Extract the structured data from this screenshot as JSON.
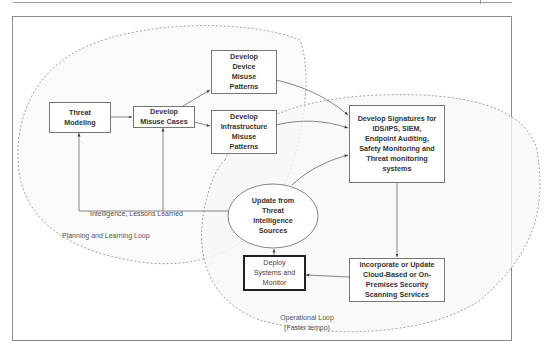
{
  "diagram": {
    "nodes": {
      "threat_modeling": {
        "label": "Threat\nModeling"
      },
      "misuse_cases": {
        "label": "Develop\nMisuse Cases"
      },
      "device_patterns": {
        "label": "Develop\nDevice\nMisuse\nPatterns"
      },
      "infra_patterns": {
        "label": "Develop\nInfrastructure\nMisuse\nPatterns"
      },
      "signatures": {
        "label": "Develop Signatures for\nIDS/IPS, SIEM,\nEndpoint Auditing,\nSafety Monitoring and\nThreat monitoring\nsystems"
      },
      "threat_intel": {
        "label": "Update from\nThreat\nIntelligence\nSources",
        "shape": "ellipse"
      },
      "deploy": {
        "label": "Deploy\nSystems and\nMonitor"
      },
      "incorporate": {
        "label": "Incorporate  or Update\nCloud-Based or On-\nPremises Security\nScanning Services"
      }
    },
    "edge_labels": {
      "feedback": "Intelligence, Lessons Learned"
    },
    "regions": {
      "planning_loop": "Planning and Learning Loop",
      "operational_loop": "Operational Loop\n(Faster tempo)"
    },
    "edges": [
      {
        "from": "threat_modeling",
        "to": "misuse_cases"
      },
      {
        "from": "misuse_cases",
        "to": "device_patterns"
      },
      {
        "from": "misuse_cases",
        "to": "infra_patterns"
      },
      {
        "from": "device_patterns",
        "to": "signatures"
      },
      {
        "from": "infra_patterns",
        "to": "signatures"
      },
      {
        "from": "threat_intel",
        "to": "signatures"
      },
      {
        "from": "signatures",
        "to": "incorporate"
      },
      {
        "from": "incorporate",
        "to": "deploy"
      },
      {
        "from": "deploy",
        "to": "threat_intel"
      },
      {
        "from": "threat_intel",
        "to": "threat_modeling",
        "label": "Intelligence, Lessons Learned"
      },
      {
        "from": "threat_intel",
        "to": "misuse_cases"
      }
    ],
    "colors": {
      "line": "#555555",
      "dashed_region": "#8a8a8a",
      "region_fill": "#f7f7f7"
    }
  }
}
